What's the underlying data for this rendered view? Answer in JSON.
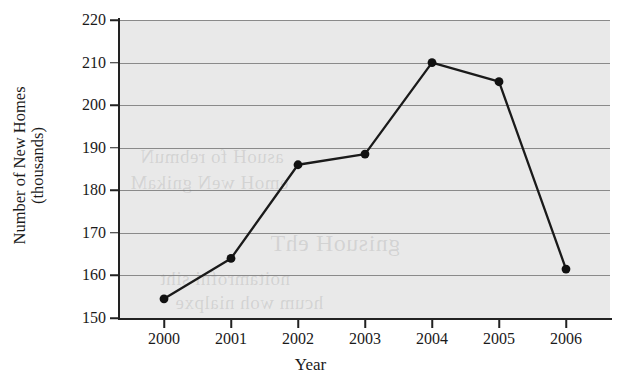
{
  "chart_data": {
    "type": "line",
    "title": "",
    "xlabel": "Year",
    "ylabel_line1": "Number of New Homes",
    "ylabel_line2": "(thousands)",
    "categories": [
      "2000",
      "2001",
      "2002",
      "2003",
      "2004",
      "2005",
      "2006"
    ],
    "values": [
      154.5,
      164,
      186,
      188.5,
      210,
      205.5,
      161.5
    ],
    "series": [
      {
        "name": "Number of New Homes (thousands)",
        "values": [
          154.5,
          164,
          186,
          188.5,
          210,
          205.5,
          161.5
        ]
      }
    ],
    "ylim": [
      150,
      220
    ],
    "ytick_labels": [
      "150",
      "160",
      "170",
      "180",
      "190",
      "200",
      "210",
      "220"
    ],
    "ytick_values": [
      150,
      160,
      170,
      180,
      190,
      200,
      210,
      220
    ],
    "grid": true,
    "legend": "none",
    "marker": "filled-circle",
    "line_color": "#1a1a1a",
    "marker_color": "#111111",
    "plot_background": "#e9e9e9",
    "gridline_color": "#8a8a8a"
  },
  "axes": {
    "x_title": "Year",
    "y_title_line1": "Number of New Homes",
    "y_title_line2": "(thousands)"
  }
}
